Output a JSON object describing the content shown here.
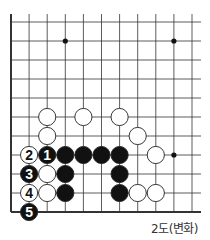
{
  "caption": "2도(변화)",
  "board": {
    "origin_x": 11,
    "origin_y": 22,
    "spacing_x": 18.1,
    "spacing_y": 19,
    "cols": 11,
    "rows": 11,
    "top_line_start": 14,
    "right_line_end": 201,
    "open_edges": [
      "top",
      "right"
    ],
    "closed_edges": [
      "left",
      "bottom"
    ],
    "hoshi": [
      [
        3,
        1
      ],
      [
        9,
        1
      ],
      [
        9,
        7
      ]
    ],
    "stones": [
      {
        "color": "white",
        "col": 2,
        "row": 5
      },
      {
        "color": "white",
        "col": 4,
        "row": 5
      },
      {
        "color": "white",
        "col": 6,
        "row": 5
      },
      {
        "color": "white",
        "col": 2,
        "row": 6
      },
      {
        "color": "white",
        "col": 7,
        "row": 6
      },
      {
        "color": "white",
        "col": 1,
        "row": 7,
        "label": "2"
      },
      {
        "color": "black",
        "col": 2,
        "row": 7,
        "label": "1"
      },
      {
        "color": "black",
        "col": 3,
        "row": 7
      },
      {
        "color": "black",
        "col": 4,
        "row": 7
      },
      {
        "color": "black",
        "col": 5,
        "row": 7
      },
      {
        "color": "black",
        "col": 6,
        "row": 7
      },
      {
        "color": "white",
        "col": 8,
        "row": 7
      },
      {
        "color": "black",
        "col": 1,
        "row": 8,
        "label": "3"
      },
      {
        "color": "white",
        "col": 2,
        "row": 8
      },
      {
        "color": "black",
        "col": 3,
        "row": 8
      },
      {
        "color": "black",
        "col": 6,
        "row": 8
      },
      {
        "color": "white",
        "col": 1,
        "row": 9,
        "label": "4"
      },
      {
        "color": "white",
        "col": 2,
        "row": 9
      },
      {
        "color": "black",
        "col": 3,
        "row": 9
      },
      {
        "color": "black",
        "col": 6,
        "row": 9
      },
      {
        "color": "white",
        "col": 7,
        "row": 9
      },
      {
        "color": "white",
        "col": 8,
        "row": 9
      },
      {
        "color": "black",
        "col": 1,
        "row": 10,
        "label": "5"
      }
    ]
  },
  "colors": {
    "line": "#333333",
    "black_stone": "#111111",
    "white_stone": "#ffffff"
  }
}
